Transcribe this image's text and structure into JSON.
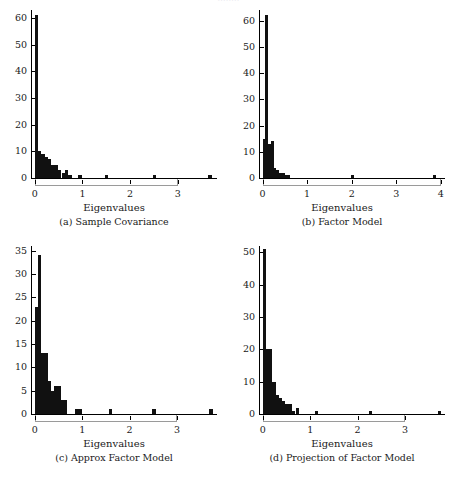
{
  "figure": {
    "clipped_header": "........",
    "xlabel": "Eigenvalues"
  },
  "chart_data": [
    {
      "id": "a",
      "type": "bar",
      "title": "(a) Sample Covariance",
      "caption": "(a) Sample Covariance",
      "xlabel": "Eigenvalues",
      "ylabel": "",
      "xlim": [
        -0.08,
        3.78
      ],
      "ylim": [
        0,
        63
      ],
      "xticks": [
        0,
        1,
        2,
        3
      ],
      "xticklabels": [
        "0",
        "1",
        "2",
        "3"
      ],
      "yticks": [
        0,
        10,
        20,
        30,
        40,
        50,
        60
      ],
      "yticklabels": [
        "0",
        "10",
        "20",
        "30",
        "40",
        "50",
        "60"
      ],
      "grid": false,
      "legend": null,
      "bin_width": 0.07,
      "bins": [
        {
          "x": 0.0,
          "count": 61
        },
        {
          "x": 0.07,
          "count": 10
        },
        {
          "x": 0.14,
          "count": 9
        },
        {
          "x": 0.21,
          "count": 8
        },
        {
          "x": 0.28,
          "count": 7
        },
        {
          "x": 0.35,
          "count": 5
        },
        {
          "x": 0.42,
          "count": 5
        },
        {
          "x": 0.49,
          "count": 3
        },
        {
          "x": 0.56,
          "count": 2
        },
        {
          "x": 0.63,
          "count": 3
        },
        {
          "x": 0.7,
          "count": 1
        },
        {
          "x": 0.77,
          "count": 0
        },
        {
          "x": 0.84,
          "count": 0
        },
        {
          "x": 0.91,
          "count": 1
        },
        {
          "x": 0.98,
          "count": 0
        },
        {
          "x": 1.47,
          "count": 1
        },
        {
          "x": 2.47,
          "count": 1
        },
        {
          "x": 3.64,
          "count": 1
        }
      ]
    },
    {
      "id": "b",
      "type": "bar",
      "title": "(b) Factor Model",
      "caption": "(b) Factor Model",
      "xlabel": "Eigenvalues",
      "ylabel": "",
      "xlim": [
        -0.08,
        4.05
      ],
      "ylim": [
        0,
        64
      ],
      "xticks": [
        0,
        1,
        2,
        3,
        4
      ],
      "xticklabels": [
        "0",
        "1",
        "2",
        "3",
        "4"
      ],
      "yticks": [
        0,
        10,
        20,
        30,
        40,
        50,
        60
      ],
      "yticklabels": [
        "0",
        "10",
        "20",
        "30",
        "40",
        "50",
        "60"
      ],
      "grid": false,
      "legend": null,
      "bin_width": 0.062,
      "bins": [
        {
          "x": 0.0,
          "count": 15
        },
        {
          "x": 0.062,
          "count": 62
        },
        {
          "x": 0.124,
          "count": 13
        },
        {
          "x": 0.186,
          "count": 14
        },
        {
          "x": 0.248,
          "count": 4
        },
        {
          "x": 0.31,
          "count": 3
        },
        {
          "x": 0.372,
          "count": 2
        },
        {
          "x": 0.434,
          "count": 2
        },
        {
          "x": 0.496,
          "count": 1
        },
        {
          "x": 0.558,
          "count": 1
        },
        {
          "x": 0.62,
          "count": 0
        },
        {
          "x": 1.98,
          "count": 1
        },
        {
          "x": 3.82,
          "count": 1
        }
      ]
    },
    {
      "id": "c",
      "type": "bar",
      "title": "(c) Approx Factor Model",
      "caption": "(c) Approx Factor Model",
      "xlabel": "Eigenvalues",
      "ylabel": "",
      "xlim": [
        -0.08,
        3.8
      ],
      "ylim": [
        0,
        36
      ],
      "xticks": [
        0,
        1,
        2,
        3
      ],
      "xticklabels": [
        "0",
        "1",
        "2",
        "3"
      ],
      "yticks": [
        0,
        5,
        10,
        15,
        20,
        25,
        30,
        35
      ],
      "yticklabels": [
        "0",
        "5",
        "10",
        "15",
        "20",
        "25",
        "30",
        "35"
      ],
      "grid": false,
      "legend": null,
      "bin_width": 0.068,
      "bins": [
        {
          "x": 0.0,
          "count": 23
        },
        {
          "x": 0.068,
          "count": 34
        },
        {
          "x": 0.136,
          "count": 13
        },
        {
          "x": 0.204,
          "count": 13
        },
        {
          "x": 0.272,
          "count": 7
        },
        {
          "x": 0.34,
          "count": 5
        },
        {
          "x": 0.408,
          "count": 6
        },
        {
          "x": 0.476,
          "count": 6
        },
        {
          "x": 0.544,
          "count": 3
        },
        {
          "x": 0.612,
          "count": 3
        },
        {
          "x": 0.68,
          "count": 0
        },
        {
          "x": 0.85,
          "count": 1
        },
        {
          "x": 0.918,
          "count": 1
        },
        {
          "x": 1.56,
          "count": 1
        },
        {
          "x": 2.48,
          "count": 1
        },
        {
          "x": 3.68,
          "count": 1
        }
      ]
    },
    {
      "id": "d",
      "type": "bar",
      "title": "(d) Projection of Factor Model",
      "caption": "(d) Projection of Factor Model",
      "xlabel": "Eigenvalues",
      "ylabel": "",
      "xlim": [
        -0.08,
        3.8
      ],
      "ylim": [
        0,
        52
      ],
      "xticks": [
        0,
        1,
        2,
        3
      ],
      "xticklabels": [
        "0",
        "1",
        "2",
        "3"
      ],
      "yticks": [
        0,
        10,
        20,
        30,
        40,
        50
      ],
      "yticklabels": [
        "0",
        "10",
        "20",
        "30",
        "40",
        "50"
      ],
      "grid": false,
      "legend": null,
      "bin_width": 0.068,
      "bins": [
        {
          "x": 0.0,
          "count": 51
        },
        {
          "x": 0.068,
          "count": 20
        },
        {
          "x": 0.136,
          "count": 20
        },
        {
          "x": 0.204,
          "count": 10
        },
        {
          "x": 0.272,
          "count": 6
        },
        {
          "x": 0.34,
          "count": 5
        },
        {
          "x": 0.408,
          "count": 4
        },
        {
          "x": 0.476,
          "count": 3
        },
        {
          "x": 0.544,
          "count": 3
        },
        {
          "x": 0.612,
          "count": 1
        },
        {
          "x": 0.7,
          "count": 2
        },
        {
          "x": 0.768,
          "count": 0
        },
        {
          "x": 1.1,
          "count": 1
        },
        {
          "x": 2.24,
          "count": 1
        },
        {
          "x": 3.7,
          "count": 1
        }
      ]
    }
  ]
}
